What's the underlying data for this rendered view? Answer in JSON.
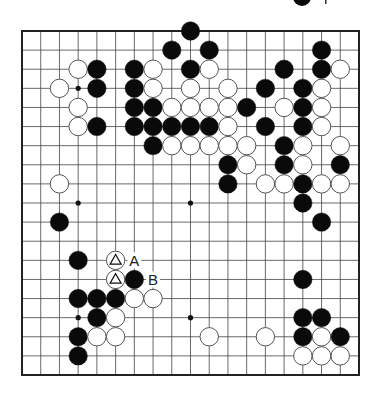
{
  "diagram": {
    "type": "go-board",
    "size": 19,
    "colors": {
      "line": "#444444",
      "border": "#222222",
      "black": "#0a0a0a",
      "white": "#ffffff",
      "stone_outline": "#555555"
    },
    "hoshi": [
      [
        3,
        3
      ],
      [
        9,
        3
      ],
      [
        15,
        3
      ],
      [
        3,
        9
      ],
      [
        9,
        9
      ],
      [
        15,
        9
      ],
      [
        3,
        15
      ],
      [
        9,
        15
      ],
      [
        15,
        15
      ]
    ],
    "stones": [
      {
        "c": 9,
        "r": 0,
        "color": "B"
      },
      {
        "c": 8,
        "r": 1,
        "color": "B"
      },
      {
        "c": 10,
        "r": 1,
        "color": "B"
      },
      {
        "c": 16,
        "r": 1,
        "color": "B"
      },
      {
        "c": 3,
        "r": 2,
        "color": "W"
      },
      {
        "c": 4,
        "r": 2,
        "color": "B"
      },
      {
        "c": 6,
        "r": 2,
        "color": "B"
      },
      {
        "c": 7,
        "r": 2,
        "color": "W"
      },
      {
        "c": 9,
        "r": 2,
        "color": "B"
      },
      {
        "c": 10,
        "r": 2,
        "color": "W"
      },
      {
        "c": 14,
        "r": 2,
        "color": "B"
      },
      {
        "c": 16,
        "r": 2,
        "color": "B"
      },
      {
        "c": 17,
        "r": 2,
        "color": "W"
      },
      {
        "c": 2,
        "r": 3,
        "color": "W"
      },
      {
        "c": 4,
        "r": 3,
        "color": "B"
      },
      {
        "c": 6,
        "r": 3,
        "color": "B"
      },
      {
        "c": 7,
        "r": 3,
        "color": "W"
      },
      {
        "c": 9,
        "r": 3,
        "color": "W"
      },
      {
        "c": 11,
        "r": 3,
        "color": "W"
      },
      {
        "c": 13,
        "r": 3,
        "color": "B"
      },
      {
        "c": 15,
        "r": 3,
        "color": "B"
      },
      {
        "c": 16,
        "r": 3,
        "color": "W"
      },
      {
        "c": 3,
        "r": 4,
        "color": "W"
      },
      {
        "c": 6,
        "r": 4,
        "color": "B"
      },
      {
        "c": 7,
        "r": 4,
        "color": "B"
      },
      {
        "c": 8,
        "r": 4,
        "color": "W"
      },
      {
        "c": 9,
        "r": 4,
        "color": "W"
      },
      {
        "c": 10,
        "r": 4,
        "color": "W"
      },
      {
        "c": 11,
        "r": 4,
        "color": "W"
      },
      {
        "c": 12,
        "r": 4,
        "color": "B"
      },
      {
        "c": 14,
        "r": 4,
        "color": "W"
      },
      {
        "c": 15,
        "r": 4,
        "color": "B"
      },
      {
        "c": 16,
        "r": 4,
        "color": "W"
      },
      {
        "c": 3,
        "r": 5,
        "color": "W"
      },
      {
        "c": 4,
        "r": 5,
        "color": "B"
      },
      {
        "c": 6,
        "r": 5,
        "color": "B"
      },
      {
        "c": 7,
        "r": 5,
        "color": "B"
      },
      {
        "c": 8,
        "r": 5,
        "color": "B"
      },
      {
        "c": 9,
        "r": 5,
        "color": "B"
      },
      {
        "c": 10,
        "r": 5,
        "color": "B"
      },
      {
        "c": 11,
        "r": 5,
        "color": "W"
      },
      {
        "c": 13,
        "r": 5,
        "color": "B"
      },
      {
        "c": 15,
        "r": 5,
        "color": "B"
      },
      {
        "c": 16,
        "r": 5,
        "color": "W"
      },
      {
        "c": 7,
        "r": 6,
        "color": "B"
      },
      {
        "c": 8,
        "r": 6,
        "color": "W"
      },
      {
        "c": 9,
        "r": 6,
        "color": "W"
      },
      {
        "c": 10,
        "r": 6,
        "color": "W"
      },
      {
        "c": 11,
        "r": 6,
        "color": "W"
      },
      {
        "c": 12,
        "r": 6,
        "color": "W"
      },
      {
        "c": 14,
        "r": 6,
        "color": "B"
      },
      {
        "c": 15,
        "r": 6,
        "color": "W"
      },
      {
        "c": 17,
        "r": 6,
        "color": "W"
      },
      {
        "c": 11,
        "r": 7,
        "color": "B"
      },
      {
        "c": 12,
        "r": 7,
        "color": "W"
      },
      {
        "c": 14,
        "r": 7,
        "color": "B"
      },
      {
        "c": 15,
        "r": 7,
        "color": "W"
      },
      {
        "c": 17,
        "r": 7,
        "color": "B"
      },
      {
        "c": 2,
        "r": 8,
        "color": "W"
      },
      {
        "c": 11,
        "r": 8,
        "color": "B"
      },
      {
        "c": 13,
        "r": 8,
        "color": "W"
      },
      {
        "c": 14,
        "r": 8,
        "color": "W"
      },
      {
        "c": 15,
        "r": 8,
        "color": "B"
      },
      {
        "c": 16,
        "r": 8,
        "color": "W"
      },
      {
        "c": 17,
        "r": 8,
        "color": "W"
      },
      {
        "c": 15,
        "r": 9,
        "color": "B"
      },
      {
        "c": 2,
        "r": 10,
        "color": "B"
      },
      {
        "c": 16,
        "r": 10,
        "color": "B"
      },
      {
        "c": 3,
        "r": 12,
        "color": "B"
      },
      {
        "c": 5,
        "r": 12,
        "color": "W",
        "mark": "triangle"
      },
      {
        "c": 5,
        "r": 13,
        "color": "W",
        "mark": "triangle"
      },
      {
        "c": 6,
        "r": 13,
        "color": "B"
      },
      {
        "c": 15,
        "r": 13,
        "color": "B"
      },
      {
        "c": 3,
        "r": 14,
        "color": "B"
      },
      {
        "c": 4,
        "r": 14,
        "color": "B"
      },
      {
        "c": 5,
        "r": 14,
        "color": "B"
      },
      {
        "c": 6,
        "r": 14,
        "color": "W"
      },
      {
        "c": 7,
        "r": 14,
        "color": "W"
      },
      {
        "c": 4,
        "r": 15,
        "color": "B"
      },
      {
        "c": 5,
        "r": 15,
        "color": "W"
      },
      {
        "c": 15,
        "r": 15,
        "color": "B"
      },
      {
        "c": 16,
        "r": 15,
        "color": "B"
      },
      {
        "c": 3,
        "r": 16,
        "color": "B"
      },
      {
        "c": 4,
        "r": 16,
        "color": "W"
      },
      {
        "c": 5,
        "r": 16,
        "color": "W"
      },
      {
        "c": 10,
        "r": 16,
        "color": "W"
      },
      {
        "c": 13,
        "r": 16,
        "color": "W"
      },
      {
        "c": 15,
        "r": 16,
        "color": "B"
      },
      {
        "c": 16,
        "r": 16,
        "color": "W"
      },
      {
        "c": 17,
        "r": 16,
        "color": "B"
      },
      {
        "c": 3,
        "r": 17,
        "color": "B"
      },
      {
        "c": 15,
        "r": 17,
        "color": "W"
      },
      {
        "c": 16,
        "r": 17,
        "color": "W"
      },
      {
        "c": 17,
        "r": 17,
        "color": "W"
      }
    ],
    "labels": [
      {
        "c": 6,
        "r": 12,
        "text": "A"
      },
      {
        "c": 7,
        "r": 13,
        "text": "B"
      }
    ],
    "header_fragment": {
      "stone_color": "B"
    }
  }
}
